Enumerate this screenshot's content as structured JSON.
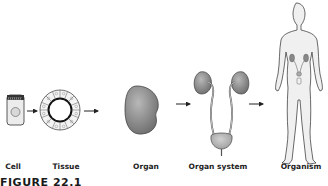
{
  "diagram": {
    "stages": [
      {
        "id": "cell",
        "label": "Cell"
      },
      {
        "id": "tissue",
        "label": "Tissue"
      },
      {
        "id": "organ",
        "label": "Organ"
      },
      {
        "id": "organ-system",
        "label": "Organ system"
      },
      {
        "id": "organism",
        "label": "Organism"
      }
    ],
    "caption": "FIGURE 22.1",
    "colors": {
      "organ_fill": "#8a8a8a",
      "outline": "#333333",
      "body_fill": "#f0f0f0",
      "cell_fill": "#ececec"
    }
  }
}
